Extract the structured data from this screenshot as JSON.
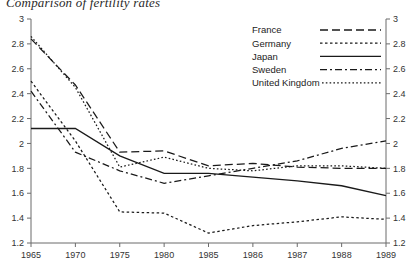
{
  "title": "Comparison of fertility rates",
  "chart_data": {
    "type": "line",
    "title": "Comparison of fertility rates",
    "xlabel": "",
    "ylabel": "",
    "categories": [
      "1965",
      "1970",
      "1975",
      "1980",
      "1985",
      "1986",
      "1987",
      "1988",
      "1989"
    ],
    "x_tick_labels": [
      "1965",
      "1970",
      "1975",
      "1980",
      "1985",
      "1986",
      "1987",
      "1988",
      "1989"
    ],
    "y_tick_labels": [
      "1.2",
      "1.4",
      "1.6",
      "1.8",
      "2",
      "2.2",
      "2.4",
      "2.6",
      "2.8",
      "3"
    ],
    "y_tick_values": [
      1.2,
      1.4,
      1.6,
      1.8,
      2.0,
      2.2,
      2.4,
      2.6,
      2.8,
      3.0
    ],
    "ylim": [
      1.2,
      3.0
    ],
    "y_axis_right": true,
    "right_y_tick_labels": [
      "1.2",
      "1.4",
      "1.6",
      "1.8",
      "2",
      "2.2",
      "2.4",
      "2.6",
      "2.8",
      "3"
    ],
    "grid": false,
    "legend_position": "top-right",
    "series": [
      {
        "name": "France",
        "dash": "8,4",
        "values": [
          2.84,
          2.47,
          1.93,
          1.94,
          1.82,
          1.84,
          1.81,
          1.8,
          1.8
        ]
      },
      {
        "name": "Germany",
        "dash": "2.5,2.5",
        "values": [
          2.5,
          2.02,
          1.45,
          1.44,
          1.28,
          1.34,
          1.37,
          1.41,
          1.39
        ]
      },
      {
        "name": "Japan",
        "dash": "none",
        "values": [
          2.12,
          2.12,
          1.9,
          1.76,
          1.76,
          1.73,
          1.7,
          1.66,
          1.58
        ]
      },
      {
        "name": "Sweden",
        "dash": "7,3,2,3",
        "values": [
          2.42,
          1.93,
          1.78,
          1.68,
          1.74,
          1.8,
          1.86,
          1.96,
          2.02
        ]
      },
      {
        "name": "United Kingdom",
        "dash": "1.6,2.2",
        "values": [
          2.86,
          2.45,
          1.81,
          1.89,
          1.8,
          1.78,
          1.82,
          1.82,
          1.8
        ]
      }
    ]
  },
  "legend": {
    "items": [
      {
        "label": "France"
      },
      {
        "label": "Germany"
      },
      {
        "label": "Japan"
      },
      {
        "label": "Sweden"
      },
      {
        "label": "United Kingdom"
      }
    ]
  },
  "colors": {
    "line": "#1a1a1a",
    "axis": "#6b6b6b",
    "text": "#2b2b2b",
    "background": "#ffffff"
  }
}
